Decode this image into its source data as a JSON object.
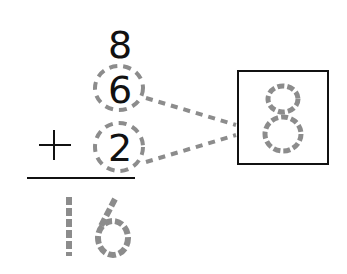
{
  "problem": {
    "addends": [
      "8",
      "6",
      "2"
    ],
    "operator": "+",
    "answer": "16",
    "grouped_sum": "8",
    "grouped_addends": [
      "6",
      "2"
    ]
  },
  "colors": {
    "ink": "#111111",
    "trace": "#8c8c8c",
    "background": "#ffffff"
  }
}
